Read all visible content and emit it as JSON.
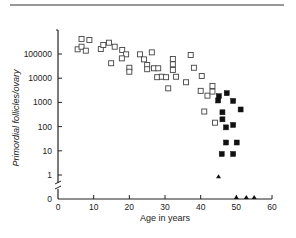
{
  "chart_data": {
    "type": "scatter",
    "title": "",
    "xlabel": "Age in years",
    "ylabel": "Primordial follicles/ovary",
    "x_scale": "linear",
    "y_scale": "log (with broken axis to 0)",
    "xlim": [
      0,
      60
    ],
    "ylim": [
      0,
      1000000
    ],
    "x_ticks": [
      "0",
      "10",
      "20",
      "30",
      "40",
      "50",
      "60"
    ],
    "y_ticks": [
      "0",
      "1",
      "10",
      "100",
      "1000",
      "10000",
      "100000"
    ],
    "grid": false,
    "legend": null,
    "series": [
      {
        "name": "open-squares",
        "marker": "square-open",
        "points": [
          [
            6.6,
            420000
          ],
          [
            8.8,
            380000
          ],
          [
            5.5,
            156000
          ],
          [
            6.6,
            200000
          ],
          [
            7.8,
            137000
          ],
          [
            12.0,
            160000
          ],
          [
            12.7,
            235000
          ],
          [
            14.3,
            293000
          ],
          [
            15.9,
            200000
          ],
          [
            14.9,
            41500
          ],
          [
            18.0,
            146000
          ],
          [
            19.1,
            97000
          ],
          [
            17.9,
            66000
          ],
          [
            20.0,
            27000
          ],
          [
            20.0,
            18500
          ],
          [
            23.0,
            97000
          ],
          [
            24.1,
            60000
          ],
          [
            25.0,
            35000
          ],
          [
            25.0,
            23500
          ],
          [
            26.3,
            117000
          ],
          [
            26.9,
            25700
          ],
          [
            28.1,
            25700
          ],
          [
            27.8,
            11000
          ],
          [
            29.1,
            11500
          ],
          [
            30.3,
            11000
          ],
          [
            30.9,
            3800
          ],
          [
            32.2,
            62000
          ],
          [
            32.2,
            37500
          ],
          [
            32.2,
            22000
          ],
          [
            33.1,
            11500
          ],
          [
            35.9,
            6800
          ],
          [
            37.2,
            91000
          ],
          [
            38.1,
            27000
          ],
          [
            40.3,
            12300
          ],
          [
            40.0,
            3000
          ],
          [
            41.9,
            1900
          ],
          [
            43.3,
            4800
          ],
          [
            43.3,
            2800
          ],
          [
            41.0,
            420
          ],
          [
            44.0,
            145
          ]
        ]
      },
      {
        "name": "filled-squares",
        "marker": "square-filled",
        "points": [
          [
            45.1,
            1800
          ],
          [
            47.3,
            2400
          ],
          [
            44.9,
            1200
          ],
          [
            49.1,
            1150
          ],
          [
            51.2,
            510
          ],
          [
            46.1,
            390
          ],
          [
            46.1,
            200
          ],
          [
            49.1,
            117
          ],
          [
            47.1,
            93
          ],
          [
            47.1,
            22
          ],
          [
            50.1,
            22
          ],
          [
            45.9,
            7.4
          ],
          [
            49.1,
            7.4
          ]
        ]
      },
      {
        "name": "triangles",
        "marker": "triangle-filled",
        "points": [
          [
            45.0,
            0.8
          ],
          [
            50.0,
            0
          ],
          [
            52.8,
            0
          ],
          [
            55.0,
            0
          ]
        ]
      }
    ]
  }
}
